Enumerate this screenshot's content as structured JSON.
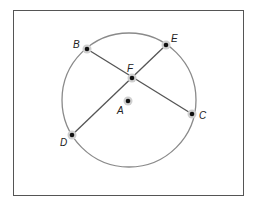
{
  "diagram": {
    "type": "geometry",
    "frame": {
      "x": 13,
      "y": 10,
      "w": 230,
      "h": 185,
      "stroke": "#555555"
    },
    "circle": {
      "center": "A",
      "cx": 129,
      "cy": 100,
      "r": 67,
      "stroke": "#8a8a8a"
    },
    "points": [
      {
        "name": "B",
        "x": 87,
        "y": 49,
        "lx": 73,
        "ly": 48
      },
      {
        "name": "E",
        "x": 166,
        "y": 45,
        "lx": 171,
        "ly": 42
      },
      {
        "name": "F",
        "x": 132,
        "y": 78,
        "lx": 127,
        "ly": 72
      },
      {
        "name": "A",
        "x": 128,
        "y": 101,
        "lx": 117,
        "ly": 114
      },
      {
        "name": "C",
        "x": 192,
        "y": 114,
        "lx": 199,
        "ly": 119
      },
      {
        "name": "D",
        "x": 72,
        "y": 135,
        "lx": 60,
        "ly": 146
      }
    ],
    "segments": [
      {
        "from": "B",
        "to": "C"
      },
      {
        "from": "D",
        "to": "E"
      }
    ],
    "segment_color": "#555555",
    "point_color": "#111111",
    "halo_color": "#cfcfcf"
  }
}
